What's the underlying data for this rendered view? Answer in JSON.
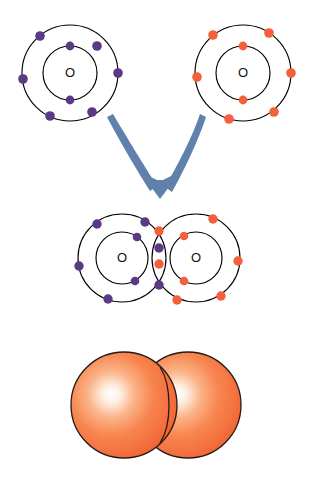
{
  "figure": {
    "background_color": "#ffffff",
    "palette": {
      "electron_purple": "#5a3a85",
      "electron_orange": "#f4603c",
      "shell_stroke": "#000000",
      "nucleus_text": "#101010",
      "arrow_blue": "#5f81ab",
      "sphere_orange": "#f4713f",
      "sphere_highlight": "#fdf0e4",
      "sphere_edge": "#241a14"
    }
  },
  "panels": [
    {
      "id": "separate-atoms",
      "name": "separate-oxygen-atoms",
      "description": "Two unbonded oxygen atoms shown as Bohr models"
    },
    {
      "id": "reaction-arrow",
      "name": "reaction-arrow",
      "description": "Blue converging V arrow pointing down"
    },
    {
      "id": "bonded-molecule",
      "name": "bonded-oxygen-molecule",
      "description": "Two oxygen Bohr models overlapping with four shared electrons"
    },
    {
      "id": "space-filling",
      "name": "space-filling-model",
      "description": "Two orange spheres overlapping representing the O2 molecule"
    }
  ],
  "atoms": {
    "left_atom": {
      "label": "O",
      "electron_color": "#5a3a85",
      "center": {
        "x": 70,
        "y": 73
      },
      "inner_radius": 27,
      "outer_radius": 48,
      "inner_electron_count": 2,
      "outer_electron_count": 6,
      "inner_electron_angles": [
        -90,
        90
      ],
      "outer_electron_angles": [
        -128,
        -56,
        -6,
        54,
        92,
        140
      ]
    },
    "right_atom": {
      "label": "O",
      "electron_color": "#f4603c",
      "center": {
        "x": 243,
        "y": 73
      },
      "inner_radius": 27,
      "outer_radius": 48,
      "inner_electron_count": 2,
      "outer_electron_count": 6,
      "inner_electron_angles": [
        -90,
        90
      ],
      "outer_electron_angles": [
        -131,
        -54,
        -3,
        52,
        95,
        142
      ]
    },
    "bonded_left": {
      "label": "O",
      "electron_color": "#5a3a85",
      "center": {
        "x": 122,
        "y": 258
      },
      "inner_radius": 26,
      "outer_radius": 44,
      "inner_electron_count": 2,
      "outer_electron_count": 4,
      "inner_electron_angles": [
        -60,
        62
      ],
      "outer_electron_angles": [
        -126,
        -58,
        4,
        66,
        124
      ]
    },
    "bonded_right": {
      "label": "O",
      "electron_color": "#f4603c",
      "center": {
        "x": 196,
        "y": 258
      },
      "inner_radius": 26,
      "outer_radius": 44,
      "inner_electron_count": 2,
      "outer_electron_count": 4,
      "inner_electron_angles": [
        -118,
        118
      ],
      "outer_electron_angles": [
        -56,
        -6,
        56,
        122,
        -124
      ]
    }
  },
  "shared_electrons": {
    "count": 4,
    "description": "Four shared electrons in the overlap region forming a double bond",
    "dots": [
      {
        "x": 159,
        "y": 232,
        "color": "#f4603c"
      },
      {
        "x": 159,
        "y": 247,
        "color": "#5a3a85"
      },
      {
        "x": 159,
        "y": 262,
        "color": "#f4603c"
      },
      {
        "x": 159,
        "y": 284,
        "color": "#5a3a85"
      }
    ]
  },
  "arrow": {
    "color": "#5f81ab",
    "direction": "down",
    "style": "converging-v",
    "tip": {
      "x": 160,
      "y": 196
    },
    "left_tail": {
      "x": 113,
      "y": 114
    },
    "right_tail": {
      "x": 200,
      "y": 114
    }
  },
  "space_filling": {
    "atom_count": 2,
    "color": "#f4713f",
    "left_sphere": {
      "cx": 124,
      "cy": 405,
      "r": 53
    },
    "right_sphere": {
      "cx": 188,
      "cy": 405,
      "r": 53
    },
    "highlight_color": "#fdf0e4",
    "edge_color": "#241a14"
  }
}
